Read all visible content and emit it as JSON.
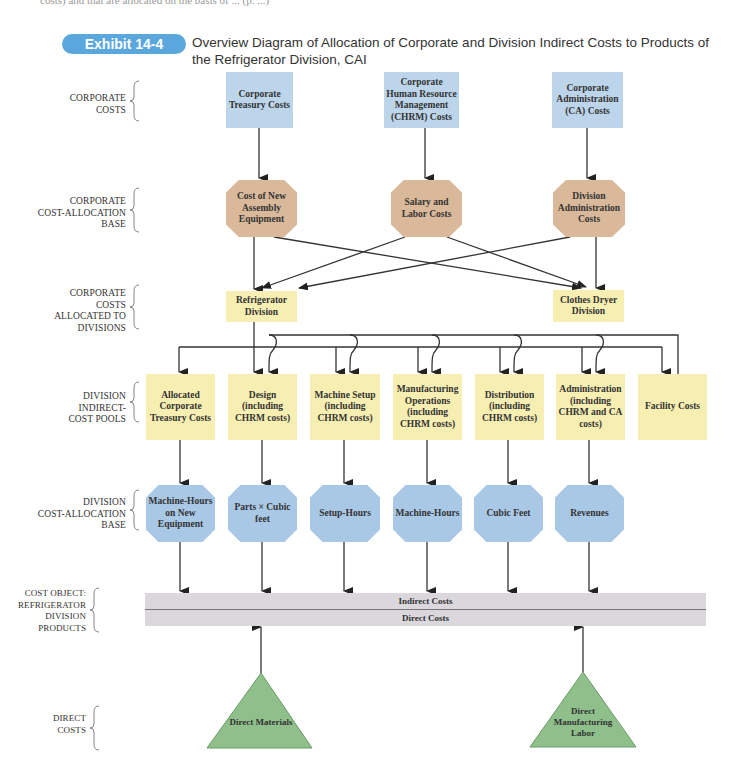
{
  "page": {
    "top_partial_text": "costs) and that are allocated on the basis of ... (p. ...)"
  },
  "exhibit": {
    "badge": "Exhibit 14-4",
    "title": "Overview Diagram of Allocation of Corporate and Division Indirect Costs to Products of the Refrigerator Division, CAI"
  },
  "row_labels": {
    "corporate_costs": [
      "CORPORATE",
      "COSTS"
    ],
    "corporate_base": [
      "CORPORATE",
      "COST-ALLOCATION",
      "BASE"
    ],
    "allocated": [
      "CORPORATE",
      "COSTS",
      "ALLOCATED TO",
      "DIVISIONS"
    ],
    "pools": [
      "DIVISION",
      "INDIRECT-",
      "COST POOLS"
    ],
    "division_base": [
      "DIVISION",
      "COST-ALLOCATION",
      "BASE"
    ],
    "cost_object": [
      "COST OBJECT:",
      "REFRIGERATOR",
      "DIVISION",
      "PRODUCTS"
    ],
    "direct": [
      "DIRECT",
      "COSTS"
    ]
  },
  "corporate_costs": [
    {
      "label": "Corporate Treasury Costs"
    },
    {
      "label": "Corporate Human Resource Management (CHRM) Costs"
    },
    {
      "label": "Corporate Administration (CA) Costs"
    }
  ],
  "corporate_bases": [
    {
      "label": "Cost of New Assembly Equipment"
    },
    {
      "label": "Salary and Labor Costs"
    },
    {
      "label": "Division Administration Costs"
    }
  ],
  "divisions": [
    {
      "label": "Refrigerator Division"
    },
    {
      "label": "Clothes Dryer Division"
    }
  ],
  "pools": [
    {
      "label": "Allocated Corporate Treasury Costs"
    },
    {
      "label": "Design (including CHRM costs)"
    },
    {
      "label": "Machine Setup (including CHRM costs)"
    },
    {
      "label": "Manufacturing Operations (including CHRM costs)"
    },
    {
      "label": "Distribution (including CHRM costs)"
    },
    {
      "label": "Administration (including CHRM and CA costs)"
    },
    {
      "label": "Facility Costs"
    }
  ],
  "division_bases": [
    {
      "label": "Machine-Hours on New Equipment"
    },
    {
      "label": "Parts × Cubic feet"
    },
    {
      "label": "Setup-Hours"
    },
    {
      "label": "Machine-Hours"
    },
    {
      "label": "Cubic Feet"
    },
    {
      "label": "Revenues"
    }
  ],
  "cost_object": {
    "indirect": "Indirect Costs",
    "direct": "Direct Costs"
  },
  "direct_costs": [
    {
      "label": "Direct Materials"
    },
    {
      "label": "Direct Manufacturing Labor"
    }
  ],
  "colors": {
    "badge": "#5aa7dd",
    "blue_box": "#bcd5ea",
    "tan_octagon": "#d9b99a",
    "yellow_box": "#f7efb2",
    "blue_octagon": "#a9c8e6",
    "bar": "#dad7dd",
    "triangle": "#8fbf8a"
  }
}
